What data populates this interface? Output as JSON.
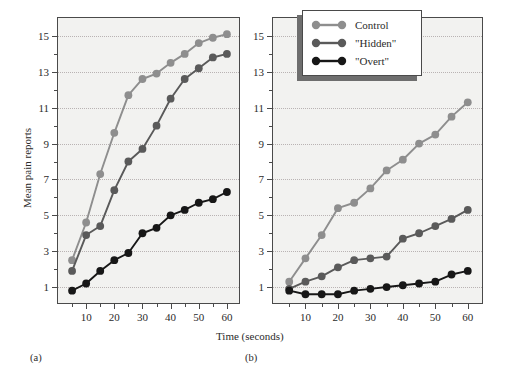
{
  "figure": {
    "ylabel": "Mean pain reports",
    "xlabel": "Time (seconds)",
    "panel_a_caption": "(a)",
    "panel_b_caption": "(b)"
  },
  "legend": {
    "position": "top-center-right",
    "items": [
      {
        "label": "Control",
        "color": "#8e8e8e"
      },
      {
        "label": "\"Hidden\"",
        "color": "#5a5a5a"
      },
      {
        "label": "\"Overt\"",
        "color": "#171717"
      }
    ]
  },
  "colors": {
    "control": "#8e8e8e",
    "hidden": "#5a5a5a",
    "overt": "#171717",
    "axis": "#4a4a4a",
    "plot_bg": "#f2f2f0",
    "grid": "#b9b3b3"
  },
  "chart_data": [
    {
      "type": "line",
      "panel": "(a)",
      "title": "",
      "xlabel": "Time (seconds)",
      "ylabel": "Mean pain reports",
      "xlim": [
        0,
        65
      ],
      "ylim": [
        0,
        16
      ],
      "xticks": [
        10,
        20,
        30,
        40,
        50,
        60
      ],
      "xticks_minor": [
        5,
        15,
        25,
        35,
        45,
        55
      ],
      "yticks": [
        1,
        3,
        5,
        7,
        9,
        11,
        13,
        15
      ],
      "yticks_minor": [
        2,
        4,
        6,
        8,
        10,
        12,
        14
      ],
      "grid": true,
      "legend": [
        "Control",
        "\"Hidden\"",
        "\"Overt\""
      ],
      "x": [
        5,
        10,
        15,
        20,
        25,
        30,
        35,
        40,
        45,
        50,
        55,
        60
      ],
      "series": [
        {
          "name": "Control",
          "color": "#8e8e8e",
          "values": [
            2.5,
            4.6,
            7.3,
            9.6,
            11.7,
            12.6,
            12.9,
            13.5,
            14.0,
            14.6,
            14.9,
            15.1
          ]
        },
        {
          "name": "\"Hidden\"",
          "color": "#5a5a5a",
          "values": [
            1.9,
            3.9,
            4.4,
            6.4,
            8.0,
            8.7,
            10.0,
            11.5,
            12.6,
            13.2,
            13.8,
            14.0
          ]
        },
        {
          "name": "\"Overt\"",
          "color": "#171717",
          "values": [
            0.8,
            1.2,
            1.9,
            2.5,
            2.9,
            4.0,
            4.3,
            5.0,
            5.3,
            5.7,
            5.9,
            6.3
          ]
        }
      ]
    },
    {
      "type": "line",
      "panel": "(b)",
      "title": "",
      "xlabel": "Time (seconds)",
      "ylabel": "Mean pain reports",
      "xlim": [
        0,
        65
      ],
      "ylim": [
        0,
        16
      ],
      "xticks": [
        10,
        20,
        30,
        40,
        50,
        60
      ],
      "xticks_minor": [
        5,
        15,
        25,
        35,
        45,
        55
      ],
      "yticks": [
        1,
        3,
        5,
        7,
        9,
        11,
        13,
        15
      ],
      "yticks_minor": [
        2,
        4,
        6,
        8,
        10,
        12,
        14
      ],
      "grid": true,
      "legend": [
        "Control",
        "\"Hidden\"",
        "\"Overt\""
      ],
      "x": [
        5,
        10,
        15,
        20,
        25,
        30,
        35,
        40,
        45,
        50,
        55,
        60
      ],
      "series": [
        {
          "name": "Control",
          "color": "#8e8e8e",
          "values": [
            1.3,
            2.6,
            3.9,
            5.4,
            5.7,
            6.5,
            7.5,
            8.1,
            9.0,
            9.5,
            10.5,
            11.3
          ]
        },
        {
          "name": "\"Hidden\"",
          "color": "#5a5a5a",
          "values": [
            0.9,
            1.3,
            1.6,
            2.1,
            2.5,
            2.6,
            2.7,
            3.7,
            4.0,
            4.4,
            4.8,
            5.3
          ]
        },
        {
          "name": "\"Overt\"",
          "color": "#171717",
          "values": [
            0.8,
            0.6,
            0.6,
            0.6,
            0.8,
            0.9,
            1.0,
            1.1,
            1.2,
            1.3,
            1.7,
            1.9
          ]
        }
      ]
    }
  ]
}
